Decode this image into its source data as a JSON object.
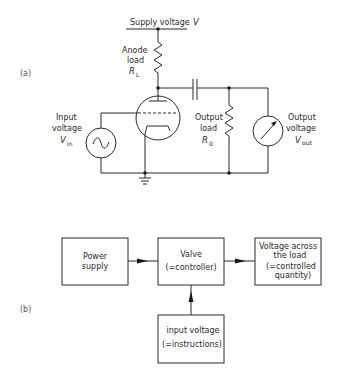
{
  "figure": {
    "part_a_label": "(a)",
    "part_b_label": "(b)"
  },
  "circuit": {
    "supply_label": "Supply voltage",
    "supply_symbol": "V",
    "anode_label_line1": "Anode",
    "anode_label_line2": "load",
    "anode_symbol": "R",
    "anode_symbol_sub": "L",
    "input_label_line1": "Input",
    "input_label_line2": "voltage",
    "input_symbol": "V",
    "input_symbol_sub": "in",
    "output_load_line1": "Output",
    "output_load_line2": "load",
    "output_load_symbol": "R",
    "output_load_sub": "0",
    "output_voltage_line1": "Output",
    "output_voltage_line2": "voltage",
    "output_voltage_symbol": "V",
    "output_voltage_sub": "out",
    "components": [
      "supply-rail",
      "anode-resistor",
      "triode-valve",
      "coupling-capacitor",
      "output-resistor",
      "ac-source",
      "voltmeter",
      "ground"
    ]
  },
  "block_diagram": {
    "power_supply": [
      "Power",
      "supply"
    ],
    "valve": [
      "Valve",
      "(=controller)"
    ],
    "output": [
      "Voltage across",
      "the load",
      "(=controlled",
      "quantity)"
    ],
    "input": [
      "input voltage",
      "(=instructions)"
    ],
    "arrows": [
      {
        "from": "power_supply",
        "to": "valve"
      },
      {
        "from": "valve",
        "to": "output"
      },
      {
        "from": "input",
        "to": "valve"
      }
    ]
  }
}
